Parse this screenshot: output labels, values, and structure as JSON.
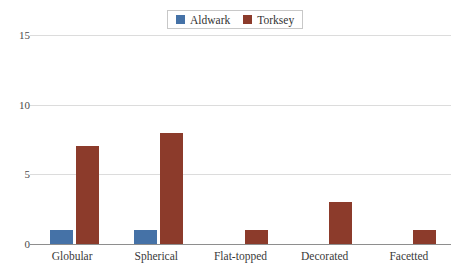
{
  "chart_data": {
    "type": "bar",
    "title": "",
    "subtitle": "",
    "xlabel": "",
    "ylabel": "",
    "categories": [
      "Globular",
      "Spherical",
      "Flat-topped",
      "Decorated",
      "Facetted"
    ],
    "series": [
      {
        "name": "Aldwark",
        "color": "#4572a7",
        "values": [
          1,
          1,
          0,
          0,
          0
        ]
      },
      {
        "name": "Torksey",
        "color": "#8c3b2b",
        "values": [
          7,
          8,
          1,
          3,
          1
        ]
      }
    ],
    "ylim": [
      0,
      15
    ],
    "yticks": [
      0,
      5,
      10,
      15
    ],
    "ytick_labels": [
      "0",
      "5",
      "10",
      "15"
    ],
    "grid": true,
    "grid_axis": "y",
    "legend_position": "top-center",
    "legend_entries": [
      "Aldwark",
      "Torksey"
    ],
    "colors": {
      "series_aldwark": "#4572a7",
      "series_torksey": "#8c3b2b",
      "gridline": "#dcdcdc",
      "axis": "#8e8e8e",
      "background": "#ffffff",
      "text": "#3a3a3a",
      "legend_border": "#c8c8c8"
    }
  }
}
